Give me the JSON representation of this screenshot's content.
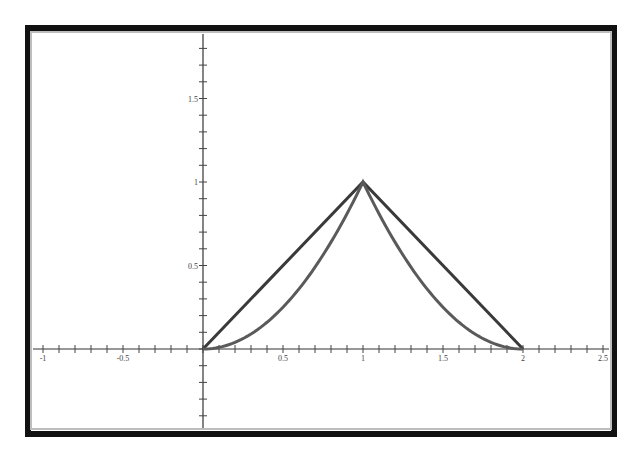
{
  "chart_data": {
    "type": "line",
    "title": "",
    "xlabel": "",
    "ylabel": "",
    "xlim": [
      -1,
      2.5
    ],
    "ylim": [
      -0.5,
      1.85
    ],
    "grid": false,
    "legend": null,
    "x_tick_labels": [
      "-1",
      "-0.5",
      "0.5",
      "1",
      "1.5",
      "2",
      "2.5"
    ],
    "y_tick_labels": [
      "0.5",
      "1",
      "1.5"
    ],
    "x_minor_tick_step": 0.1,
    "y_minor_tick_step": 0.1,
    "series": [
      {
        "name": "triangle (tent) function",
        "color": "#3a3a3a",
        "points": [
          [
            0,
            0
          ],
          [
            1,
            1
          ],
          [
            2,
            0
          ]
        ]
      },
      {
        "name": "curved piecewise (concave-up arcs)",
        "color": "#5a5a5a",
        "points": [
          [
            0,
            0
          ],
          [
            0.25,
            0.06
          ],
          [
            0.5,
            0.25
          ],
          [
            0.75,
            0.56
          ],
          [
            1,
            1
          ],
          [
            1.25,
            0.56
          ],
          [
            1.5,
            0.25
          ],
          [
            1.75,
            0.06
          ],
          [
            2,
            0
          ]
        ]
      }
    ]
  },
  "axes": {
    "x_ticks": [
      {
        "value": -1,
        "label": "-1"
      },
      {
        "value": -0.5,
        "label": "-0.5"
      },
      {
        "value": 0.5,
        "label": "0.5"
      },
      {
        "value": 1,
        "label": "1"
      },
      {
        "value": 1.5,
        "label": "1.5"
      },
      {
        "value": 2,
        "label": "2"
      },
      {
        "value": 2.5,
        "label": "2.5"
      }
    ],
    "y_ticks": [
      {
        "value": 0.5,
        "label": "0.5"
      },
      {
        "value": 1,
        "label": "1"
      },
      {
        "value": 1.5,
        "label": "1.5"
      }
    ]
  }
}
